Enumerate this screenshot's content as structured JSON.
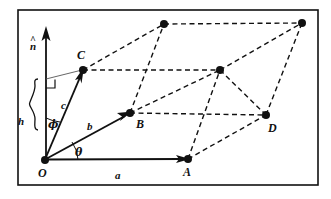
{
  "figure": {
    "background_color": "#ffffff",
    "ink_color": "#111111",
    "border": {
      "x": 18,
      "y": 10,
      "width": 300,
      "height": 175,
      "stroke_width": 1.5
    },
    "vertices": {
      "O": {
        "x": 45,
        "y": 160,
        "label": "O",
        "label_x": 38,
        "label_y": 176,
        "dot": true
      },
      "A": {
        "x": 188,
        "y": 159,
        "label": "A",
        "label_x": 184,
        "label_y": 176,
        "dot": true
      },
      "B": {
        "x": 130,
        "y": 113,
        "label": "B",
        "label_x": 136,
        "label_y": 127,
        "dot": true
      },
      "C": {
        "x": 83,
        "y": 70,
        "label": "C",
        "label_x": 78,
        "label_y": 58,
        "dot": true
      },
      "D": {
        "x": 266,
        "y": 115,
        "label": "D",
        "label_x": 268,
        "label_y": 131,
        "dot": true
      },
      "C_plus_a": {
        "x": 164,
        "y": 24,
        "label": "",
        "label_x": 0,
        "label_y": 0,
        "dot": true
      },
      "B_plus_a": {
        "x": 220,
        "y": 70,
        "label": "",
        "label_x": 0,
        "label_y": 0,
        "dot": true
      },
      "far_top": {
        "x": 302,
        "y": 23,
        "label": "",
        "label_x": 0,
        "label_y": 0,
        "dot": true
      }
    },
    "solid_edges": [
      {
        "name": "vector-a-OA",
        "from": "O",
        "to": "A",
        "arrow": true
      },
      {
        "name": "vector-b-OB",
        "from": "O",
        "to": "B",
        "arrow": true
      },
      {
        "name": "vector-c-OC",
        "from": "O",
        "to": "C",
        "arrow": true
      }
    ],
    "dashed_edges": [
      {
        "name": "edge-C-to-Cplusa",
        "from": "C",
        "to": "C_plus_a"
      },
      {
        "name": "edge-C-to-Bplusa",
        "from": "C",
        "to": "B_plus_a"
      },
      {
        "name": "edge-B-to-Bplusa",
        "from": "B",
        "to": "B_plus_a"
      },
      {
        "name": "edge-B-to-Cplusa",
        "from": "B",
        "to": "C_plus_a"
      },
      {
        "name": "edge-Cplusa-to-fartop",
        "from": "C_plus_a",
        "to": "far_top"
      },
      {
        "name": "edge-Bplusa-to-fartop",
        "from": "B_plus_a",
        "to": "far_top"
      },
      {
        "name": "edge-Bplusa-to-D",
        "from": "B_plus_a",
        "to": "D"
      },
      {
        "name": "edge-D-to-fartop",
        "from": "D",
        "to": "far_top"
      },
      {
        "name": "edge-A-to-D",
        "from": "A",
        "to": "D"
      },
      {
        "name": "edge-A-to-Bplusa",
        "from": "A",
        "to": "B_plus_a"
      }
    ],
    "normal_axis": {
      "name": "normal-vector-n-hat",
      "x": 46,
      "y_bottom": 160,
      "y_top": 28,
      "label": "n",
      "label_x": 31,
      "label_y": 48,
      "hat": "^"
    },
    "height_brace": {
      "name": "height-brace-h",
      "x": 34,
      "y_top": 79,
      "y_bottom": 131,
      "label": "h",
      "label_x": 20,
      "label_y": 124
    },
    "right_angle": {
      "name": "right-angle-marker",
      "x": 46,
      "y": 79,
      "size": 9
    },
    "projection_line": {
      "name": "projection-line-to-C",
      "x1": 46,
      "y1": 79,
      "x2": 83,
      "y2": 70
    },
    "angles": [
      {
        "name": "angle-phi",
        "label": "ϕ",
        "label_x": 49,
        "label_y": 127,
        "arc_cx": 46,
        "arc_cy": 160,
        "arc_r": 44
      },
      {
        "name": "angle-theta",
        "label": "θ",
        "label_x": 76,
        "label_y": 155,
        "arc_cx": 45,
        "arc_cy": 160,
        "arc_r": 33
      }
    ],
    "vector_labels": [
      {
        "name": "label-vector-a",
        "text": "a",
        "x": 117,
        "y": 177
      },
      {
        "name": "label-vector-b",
        "text": "b",
        "x": 88,
        "y": 129
      },
      {
        "name": "label-vector-c",
        "text": "c",
        "x": 62,
        "y": 108
      }
    ]
  }
}
